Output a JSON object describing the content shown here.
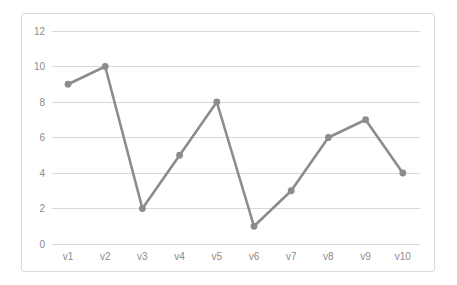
{
  "chart_data": {
    "type": "line",
    "title": "",
    "subtitle": "",
    "xlabel": "",
    "ylabel": "",
    "categories": [
      "v1",
      "v2",
      "v3",
      "v4",
      "v5",
      "v6",
      "v7",
      "v8",
      "v9",
      "v10"
    ],
    "values": [
      9,
      10,
      2,
      5,
      8,
      1,
      3,
      6,
      7,
      4
    ],
    "series": [
      {
        "name": "",
        "values": [
          9,
          10,
          2,
          5,
          8,
          1,
          3,
          6,
          7,
          4
        ]
      }
    ],
    "ylim": [
      0,
      12
    ],
    "y_ticks": [
      0,
      2,
      4,
      6,
      8,
      10,
      12
    ],
    "y_tick_labels": [
      "0",
      "2",
      "4",
      "6",
      "8",
      "10",
      "12"
    ],
    "x_tick_labels": [
      "v1",
      "v2",
      "v3",
      "v4",
      "v5",
      "v6",
      "v7",
      "v8",
      "v9",
      "v10"
    ],
    "grid": {
      "horizontal": true,
      "vertical": false
    },
    "legend": {
      "visible": false,
      "position": "none",
      "entries": []
    },
    "annotations": [],
    "markers": {
      "visible": true,
      "shape": "circle"
    }
  },
  "style": {
    "series_color": "#8c8c8c",
    "marker_color": "#8c8c8c",
    "gridline_color": "#d8d8d8",
    "tick_label_color": "#8c8c8c",
    "border_color": "#d9d9d9",
    "background_color": "#ffffff"
  },
  "layout": {
    "plot_left": 52,
    "plot_right": 420,
    "plot_top": 31,
    "plot_bottom": 244,
    "frame_left": 21,
    "frame_top": 13,
    "frame_width": 414,
    "frame_height": 259,
    "first_point_x": 68,
    "point_spacing": 37.2,
    "x_label_y": 260,
    "y_label_x": 45,
    "marker_radius": 3.4
  }
}
